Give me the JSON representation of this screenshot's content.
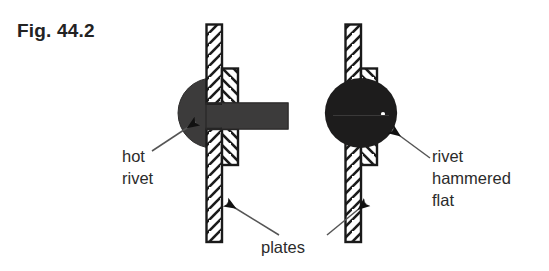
{
  "figure": {
    "title": "Fig. 44.2",
    "background_color": "#ffffff"
  },
  "labels": {
    "hot_rivet": {
      "lines": [
        "hot",
        "rivet"
      ],
      "line1": "hot",
      "line2": "rivet"
    },
    "rivet_hammered_flat": {
      "lines": [
        "rivet",
        "hammered",
        "flat"
      ],
      "line1": "rivet",
      "line2": "hammered",
      "line3": "flat"
    },
    "plates": {
      "text": "plates"
    }
  },
  "colors": {
    "ink": "#232323",
    "text": "#2b2b2b",
    "rivet_left_fill": "#3c3b3b",
    "rivet_right_fill": "#1d1c1c",
    "plate_outline": "#1a1a1a",
    "plate_fill": "#ffffff",
    "hatch": "#1a1a1a",
    "leader": "#555555",
    "arrowhead": "#111111"
  },
  "assemblies": [
    {
      "name": "hot-rivet-assembly",
      "state": "before hammering",
      "rivet": {
        "head_shape": "rounded dome",
        "head_side": "left",
        "shank_shape": "straight cylindrical",
        "shank_side": "right",
        "fill": "#3c3b3b"
      },
      "plates": {
        "count": 2,
        "near_plate": "full length vertical",
        "far_plate": "short, upper portion only"
      }
    },
    {
      "name": "hammered-rivet-assembly",
      "state": "after hammering",
      "rivet": {
        "head_shape": "symmetric lens / flattened on both sides",
        "head_side": "both",
        "fill": "#1d1c1c"
      },
      "plates": {
        "count": 2,
        "near_plate": "full length vertical",
        "far_plate": "short, upper portion only"
      }
    }
  ],
  "leaders": [
    {
      "name": "leader-hot-rivet",
      "from": "hot rivet label",
      "to": "left rivet head"
    },
    {
      "name": "leader-rivet-hammered-flat",
      "from": "rivet hammered flat label",
      "to": "right rivet body"
    },
    {
      "name": "leader-plates-left",
      "from": "plates label",
      "to": "left assembly plate"
    },
    {
      "name": "leader-plates-right",
      "from": "plates label",
      "to": "right assembly plate"
    }
  ]
}
